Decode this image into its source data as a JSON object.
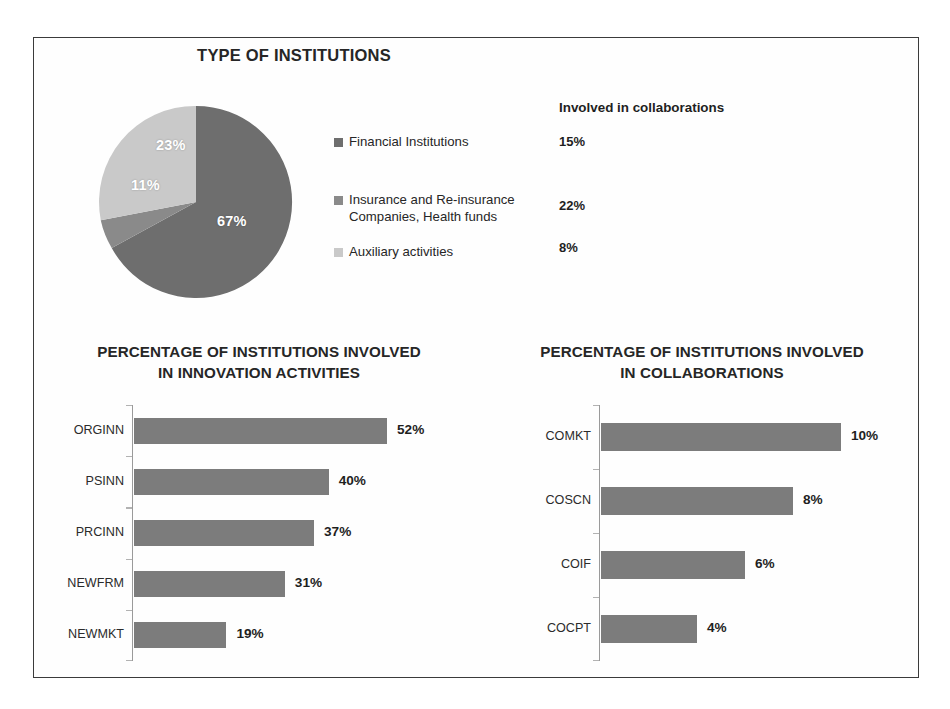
{
  "figure": {
    "background": "#ffffff",
    "frame_color": "#3b3b3b"
  },
  "palette": {
    "dark_gray": "#6e6e6e",
    "mid_gray": "#8a8a8a",
    "light_gray": "#c9c9c9",
    "bar_gray": "#7c7c7c",
    "axis_gray": "#9a9a9a",
    "text": "#262626"
  },
  "pie_panel": {
    "title": "TYPE OF INSTITUTIONS",
    "legend": [
      {
        "label": "Financial Institutions",
        "color": "#6e6e6e"
      },
      {
        "label": "Insurance and Re-insurance\nCompanies, Health funds",
        "color": "#8a8a8a"
      },
      {
        "label": "Auxiliary activities",
        "color": "#c9c9c9"
      }
    ],
    "collaborations": {
      "header": "Involved in collaborations",
      "values": [
        "15%",
        "22%",
        "8%"
      ]
    }
  },
  "chart_data": [
    {
      "type": "pie",
      "title": "TYPE OF INSTITUTIONS",
      "categories": [
        "Financial Institutions",
        "Insurance and Re-insurance Companies, Health funds",
        "Auxiliary activities"
      ],
      "values": [
        67,
        11,
        23
      ],
      "labels": [
        "67%",
        "11%",
        "23%"
      ],
      "colors": [
        "#6e6e6e",
        "#8a8a8a",
        "#c9c9c9"
      ],
      "legend_position": "right",
      "start_angle_deg": 0,
      "direction": "clockwise",
      "annotations": {
        "column_header": "Involved in collaborations",
        "column_values": [
          "15%",
          "22%",
          "8%"
        ]
      }
    },
    {
      "type": "bar",
      "orientation": "horizontal",
      "title": "PERCENTAGE OF INSTITUTIONS INVOLVED IN INNOVATION ACTIVITIES",
      "title_lines": [
        "PERCENTAGE OF INSTITUTIONS INVOLVED",
        "IN INNOVATION ACTIVITIES"
      ],
      "categories": [
        "ORGINN",
        "PSINN",
        "PRCINN",
        "NEWFRM",
        "NEWMKT"
      ],
      "values": [
        52,
        40,
        37,
        31,
        19
      ],
      "labels": [
        "52%",
        "40%",
        "37%",
        "31%",
        "19%"
      ],
      "xlabel": "",
      "ylabel": "",
      "xlim": [
        0,
        60
      ],
      "grid": false,
      "legend": false,
      "bar_color": "#7c7c7c"
    },
    {
      "type": "bar",
      "orientation": "horizontal",
      "title": "PERCENTAGE OF INSTITUTIONS INVOLVED IN COLLABORATIONS",
      "title_lines": [
        "PERCENTAGE OF INSTITUTIONS INVOLVED",
        "IN COLLABORATIONS"
      ],
      "categories": [
        "COMKT",
        "COSCN",
        "COIF",
        "COCPT"
      ],
      "values": [
        10,
        8,
        6,
        4
      ],
      "labels": [
        "10%",
        "8%",
        "6%",
        "4%"
      ],
      "xlabel": "",
      "ylabel": "",
      "xlim": [
        0,
        11.5
      ],
      "grid": false,
      "legend": false,
      "bar_color": "#7c7c7c"
    }
  ]
}
